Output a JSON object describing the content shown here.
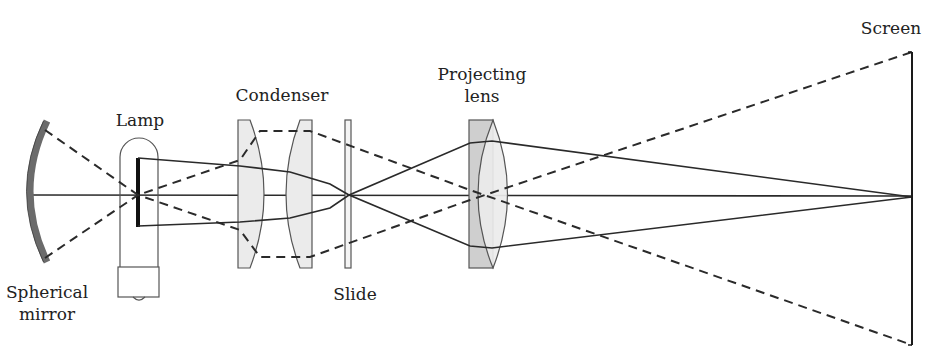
{
  "labels": {
    "spherical_mirror": "Spherical\nmirror",
    "spherical_mirror_line1": "Spherical",
    "spherical_mirror_line2": "mirror",
    "lamp": "Lamp",
    "condenser": "Condenser",
    "slide": "Slide",
    "projecting_lens_line1": "Projecting",
    "projecting_lens_line2": "lens",
    "screen": "Screen"
  },
  "colors": {
    "stroke": "#2a2a2a",
    "mirror_fill": "#6b6b6b",
    "lens_fill": "#ebebeb",
    "projecting_plate_fill": "#cfcfcf",
    "background": "#ffffff"
  },
  "components": [
    {
      "id": "spherical-mirror",
      "name": "Spherical mirror",
      "x": 45,
      "y_top": 122,
      "y_bottom": 260
    },
    {
      "id": "lamp",
      "name": "Lamp",
      "x_left": 120,
      "x_right": 158,
      "y_top": 138,
      "y_base_top": 268,
      "y_base_bottom": 298,
      "filament_x": 138,
      "filament_y_top": 158,
      "filament_y_bottom": 226
    },
    {
      "id": "condenser-lens-1",
      "name": "Condenser lens 1",
      "x_left": 238,
      "x_right": 265,
      "y_top": 120,
      "y_bottom": 268
    },
    {
      "id": "condenser-lens-2",
      "name": "Condenser lens 2",
      "x_left": 285,
      "x_right": 312,
      "y_top": 120,
      "y_bottom": 268
    },
    {
      "id": "slide",
      "name": "Slide",
      "x_left": 345,
      "x_right": 351,
      "y_top": 120,
      "y_bottom": 268
    },
    {
      "id": "projecting-lens",
      "name": "Projecting lens",
      "x_left": 469,
      "x_right": 505,
      "y_top": 120,
      "y_bottom": 268
    },
    {
      "id": "screen",
      "name": "Screen",
      "x": 912,
      "y_top": 52,
      "y_bottom": 345
    }
  ],
  "optical_axis": {
    "y": 195,
    "x_start": 30,
    "x_end": 912
  },
  "rays": {
    "solid": [
      {
        "id": "illumination-upper",
        "points": "138,158 240,166 290,172 330,184 349,195 470,143 492,141 912,197"
      },
      {
        "id": "illumination-lower",
        "points": "138,226 240,222 290,218 330,208 349,195 470,246 492,248 912,197"
      }
    ],
    "dashed": [
      {
        "id": "mirror-upper-to-lower",
        "points": "45,130 138,195 240,160 260,131 310,131 470,190 912,345"
      },
      {
        "id": "mirror-lower-to-upper",
        "points": "45,258 138,195 240,230 260,257 310,257 470,200 912,52"
      }
    ]
  }
}
